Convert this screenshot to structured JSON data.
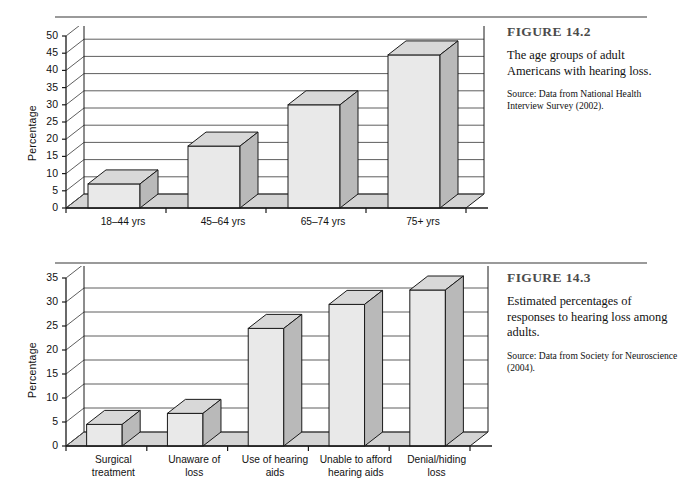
{
  "figures": [
    {
      "id": "figure-14-2",
      "title": "FIGURE 14.2",
      "description": "The age groups of adult Americans with hearing loss.",
      "source": "Source: Data from National Health Interview Survey (2002)."
    },
    {
      "id": "figure-14-3",
      "title": "FIGURE 14.3",
      "description": "Estimated percentages of responses to hearing loss among adults.",
      "source": "Source: Data from Society for Neuroscience (2004)."
    }
  ],
  "chart_data": [
    {
      "type": "bar",
      "title": "The age groups of adult Americans with hearing loss",
      "categories": [
        "18–44 yrs",
        "45–64 yrs",
        "65–74 yrs",
        "75+ yrs"
      ],
      "values": [
        7,
        18,
        30,
        44.5
      ],
      "xlabel": "",
      "ylabel": "Percentage",
      "ylim": [
        0,
        50
      ],
      "ytick_step": 5,
      "yticks": [
        0,
        5,
        10,
        15,
        20,
        25,
        30,
        35,
        40,
        45,
        50
      ],
      "grid": true,
      "legend": "none",
      "style": "3d-bar",
      "colors": {
        "bar_front": "#e9e9e9",
        "bar_side": "#b9b9b9",
        "bar_top": "#d8d8d8",
        "floor": "#d4d4d4",
        "axis": "#1a1a1a",
        "grid": "#4d4d4d"
      }
    },
    {
      "type": "bar",
      "title": "Estimated percentages of responses to hearing loss among adults",
      "categories": [
        "Surgical\ntreatment",
        "Unaware of\nloss",
        "Use of hearing\naids",
        "Unable to afford\nhearing aids",
        "Denial/hiding\nloss"
      ],
      "values": [
        4.5,
        6.8,
        24.5,
        29.5,
        32.5
      ],
      "xlabel": "",
      "ylabel": "Percentage",
      "ylim": [
        0,
        35
      ],
      "ytick_step": 5,
      "yticks": [
        0,
        5,
        10,
        15,
        20,
        25,
        30,
        35
      ],
      "grid": true,
      "legend": "none",
      "style": "3d-bar",
      "colors": {
        "bar_front": "#e9e9e9",
        "bar_side": "#b9b9b9",
        "bar_top": "#d8d8d8",
        "floor": "#d4d4d4",
        "axis": "#1a1a1a",
        "grid": "#4d4d4d"
      }
    }
  ]
}
